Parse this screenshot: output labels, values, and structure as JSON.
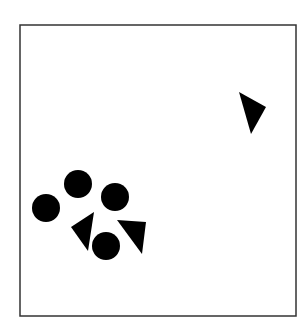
{
  "diagram": {
    "background": "#ffffff",
    "frame": {
      "x": 20,
      "y": 25,
      "width": 276,
      "height": 291,
      "stroke": "#333333",
      "stroke_width": 1.5
    },
    "fill": "#000000",
    "circles": [
      {
        "id": "circle-1",
        "cx": 78,
        "cy": 184,
        "r": 14
      },
      {
        "id": "circle-2",
        "cx": 46,
        "cy": 208,
        "r": 14
      },
      {
        "id": "circle-3",
        "cx": 115,
        "cy": 197,
        "r": 14
      },
      {
        "id": "circle-4",
        "cx": 106,
        "cy": 246,
        "r": 14
      }
    ],
    "triangles": [
      {
        "id": "triangle-top-right",
        "points": [
          [
            239,
            92
          ],
          [
            266,
            107
          ],
          [
            251,
            134
          ]
        ]
      },
      {
        "id": "triangle-left",
        "points": [
          [
            71,
            227
          ],
          [
            94,
            212
          ],
          [
            88,
            251
          ]
        ]
      },
      {
        "id": "triangle-right",
        "points": [
          [
            117,
            220
          ],
          [
            146,
            222
          ],
          [
            142,
            254
          ]
        ]
      }
    ]
  }
}
